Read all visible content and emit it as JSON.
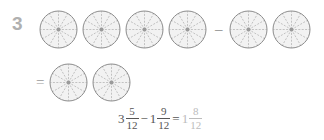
{
  "problem": {
    "number": "3",
    "model_circle_sectors": 12,
    "rows": [
      {
        "name": "top",
        "items": [
          {
            "type": "pie",
            "sectors": 12,
            "shaded": 12
          },
          {
            "type": "pie",
            "sectors": 12,
            "shaded": 12
          },
          {
            "type": "pie",
            "sectors": 12,
            "shaded": 12
          },
          {
            "type": "pie",
            "sectors": 12,
            "shaded": 5
          },
          {
            "type": "operator",
            "symbol": "–",
            "name": "minus"
          },
          {
            "type": "pie",
            "sectors": 12,
            "shaded": 12
          },
          {
            "type": "pie",
            "sectors": 12,
            "shaded": 9
          }
        ]
      },
      {
        "name": "bottom",
        "items": [
          {
            "type": "operator",
            "symbol": "=",
            "name": "equals"
          },
          {
            "type": "pie",
            "sectors": 12,
            "shaded": 12
          },
          {
            "type": "pie",
            "sectors": 12,
            "shaded": 8
          }
        ]
      }
    ]
  },
  "equation": {
    "minuend": {
      "whole": "3",
      "numerator": "5",
      "denominator": "12"
    },
    "operator": "−",
    "subtrahend": {
      "whole": "1",
      "numerator": "9",
      "denominator": "12"
    },
    "equals": "=",
    "answer": {
      "whole": "1",
      "numerator": "8",
      "denominator": "12"
    }
  },
  "colors": {
    "circle_stroke": "#8c8c8c",
    "spoke_dash": "#b5b5b5",
    "shade_fill": "#f2f2f2",
    "hub": "#9a9a9a",
    "problem_number": "#b0b0b0",
    "equation_text": "#555555",
    "answer_text": "#bcbcbc",
    "background": "#ffffff"
  }
}
